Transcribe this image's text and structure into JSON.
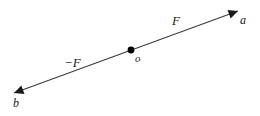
{
  "figure": {
    "name": "action-reaction-force-line-diagram",
    "canvas": {
      "width": 260,
      "height": 116,
      "background": "#ffffff"
    },
    "line": {
      "name": "force-line",
      "color": "#3a3a3a",
      "width": 1.1,
      "start": {
        "x": 14,
        "y": 93
      },
      "end": {
        "x": 238,
        "y": 11
      }
    },
    "arrowheads": [
      {
        "name": "arrowhead-b",
        "at": {
          "x": 14,
          "y": 93
        },
        "direction": "down-left",
        "color": "#1a1a1a"
      },
      {
        "name": "arrowhead-a",
        "at": {
          "x": 238,
          "y": 11
        },
        "direction": "up-right",
        "color": "#1a1a1a"
      }
    ],
    "origin_point": {
      "name": "origin-dot",
      "at": {
        "x": 131,
        "y": 50
      },
      "radius": 3.4,
      "color": "#000000"
    },
    "labels": {
      "force_positive": "F",
      "force_negative": "−F",
      "origin": "o",
      "endpoint_a": "a",
      "endpoint_b": "b"
    }
  }
}
